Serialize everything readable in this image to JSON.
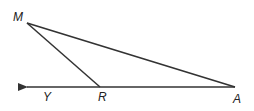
{
  "diagram": {
    "points": {
      "M": {
        "label": "M",
        "x": 27,
        "y": 23
      },
      "R": {
        "label": "R",
        "x": 100,
        "y": 87
      },
      "A": {
        "label": "A",
        "x": 235,
        "y": 87
      },
      "Y": {
        "label": "Y",
        "x": 46,
        "y": 87
      }
    },
    "segments": [
      [
        "M",
        "R"
      ],
      [
        "M",
        "A"
      ],
      [
        "R",
        "A"
      ]
    ],
    "ray": {
      "from": "A",
      "through": "Y",
      "arrow_end_x": 25
    },
    "stroke_color": "#333333"
  }
}
